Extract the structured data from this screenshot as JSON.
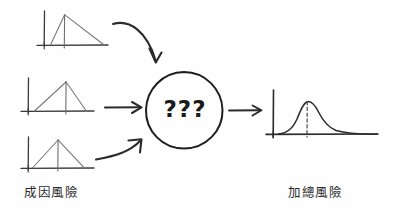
{
  "diagram": {
    "title_left": "成因風險",
    "title_right": "加總風險",
    "center_node_label": "???",
    "stroke_color": "#3a3a3a",
    "curve_color": "#6b6b6b",
    "background": "#fefefe"
  },
  "inputs": [
    {
      "name": "input-distribution-1",
      "shape": "triangular",
      "skew": "right-skewed",
      "peak_position": 0.25,
      "axis_origin": [
        44,
        45
      ],
      "axis_top": [
        44,
        11
      ],
      "axis_right": [
        108,
        45
      ],
      "peak": [
        64,
        15
      ],
      "left_base": [
        50,
        45
      ],
      "right_base": [
        104,
        45
      ],
      "mode_tick_x": 64
    },
    {
      "name": "input-distribution-2",
      "shape": "triangular",
      "skew": "slightly-left-skewed",
      "peak_position": 0.66,
      "axis_origin": [
        28,
        111
      ],
      "axis_top": [
        28,
        78
      ],
      "axis_right": [
        94,
        111
      ],
      "peak": [
        66,
        82
      ],
      "left_base": [
        34,
        111
      ],
      "right_base": [
        86,
        111
      ],
      "mode_tick_x": 66
    },
    {
      "name": "input-distribution-3",
      "shape": "triangular",
      "skew": "symmetric",
      "peak_position": 0.5,
      "axis_origin": [
        28,
        168
      ],
      "axis_top": [
        28,
        137
      ],
      "axis_right": [
        94,
        168
      ],
      "peak": [
        58,
        140
      ],
      "left_base": [
        32,
        168
      ],
      "right_base": [
        84,
        168
      ],
      "mode_tick_x": 58
    }
  ],
  "output": {
    "name": "output-distribution",
    "shape": "bell-curve",
    "skew": "right-skewed",
    "axis_origin": [
      273,
      134
    ],
    "axis_top": [
      273,
      90
    ],
    "axis_right": [
      378,
      134
    ],
    "peak": [
      307,
      102
    ],
    "mode_line_x": 307,
    "mode_line_style": "dashed"
  },
  "arrows": [
    {
      "name": "arrow-input-1",
      "style": "curved-down",
      "from": [
        112,
        25
      ],
      "to": [
        156,
        64
      ]
    },
    {
      "name": "arrow-input-2",
      "style": "straight",
      "from": [
        105,
        107
      ],
      "to": [
        140,
        107
      ]
    },
    {
      "name": "arrow-input-3",
      "style": "curved-up",
      "from": [
        98,
        158
      ],
      "to": [
        142,
        144
      ]
    },
    {
      "name": "arrow-output",
      "style": "straight",
      "from": [
        228,
        110
      ],
      "to": [
        262,
        110
      ]
    }
  ],
  "center_node": {
    "name": "unknown-aggregation-node",
    "shape": "circle",
    "center": [
      184,
      110
    ],
    "radius": 38
  }
}
